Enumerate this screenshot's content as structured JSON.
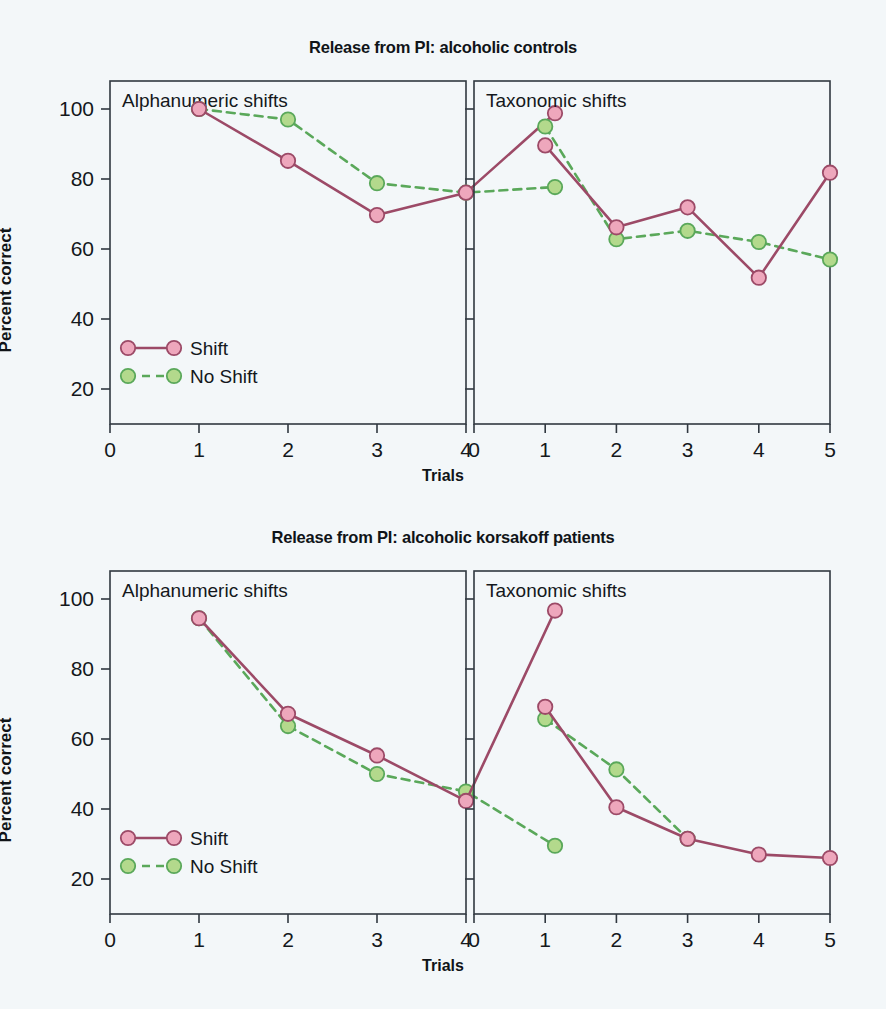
{
  "figure": {
    "axis": {
      "ylabel": "Percent correct",
      "xlabel": "Trials",
      "yticks": [
        "20",
        "40",
        "60",
        "80",
        "100"
      ],
      "ytick_values": [
        20,
        40,
        60,
        80,
        100
      ],
      "ylim": [
        10,
        108
      ],
      "xticks_left": [
        "0",
        "1",
        "2",
        "3",
        "4"
      ],
      "xticks_right": [
        "0",
        "1",
        "2",
        "3",
        "4",
        "5"
      ],
      "xlim": [
        0,
        5.2
      ]
    },
    "legend": {
      "shift_label": "Shift",
      "noshift_label": "No Shift"
    },
    "colors": {
      "shift_marker": "#eea7bc",
      "shift_line": "#9c4a67",
      "noshift_marker": "#b3d98c",
      "noshift_line": "#5aa85a",
      "frame": "#303840",
      "background": "#f3f7f9"
    }
  },
  "chart_data": [
    {
      "type": "line",
      "title": "Release from PI: alcoholic controls",
      "xlabel": "Trials",
      "ylabel": "Percent correct",
      "ylim": [
        10,
        108
      ],
      "grid": false,
      "legend_position": "lower-left of left panel",
      "panels": [
        {
          "panel_label": "Alphanumeric shifts",
          "x": [
            1,
            2,
            3,
            4,
            5
          ],
          "xtick_labels": [
            "0",
            "1",
            "2",
            "3",
            "4"
          ],
          "series": [
            {
              "name": "Shift",
              "values": [
                100,
                85.2,
                69.7,
                76.1,
                98.8
              ]
            },
            {
              "name": "No Shift",
              "values": [
                100,
                97.0,
                78.8,
                76.1,
                77.7
              ]
            }
          ]
        },
        {
          "panel_label": "Taxonomic shifts",
          "x": [
            1,
            2,
            3,
            4,
            5
          ],
          "xtick_labels": [
            "0",
            "1",
            "2",
            "3",
            "4",
            "5"
          ],
          "series": [
            {
              "name": "Shift",
              "values": [
                89.6,
                66.2,
                71.9,
                51.8,
                81.8
              ]
            },
            {
              "name": "No Shift",
              "values": [
                95.0,
                62.8,
                65.2,
                62.0,
                57.0
              ]
            }
          ]
        }
      ]
    },
    {
      "type": "line",
      "title": "Release from PI: alcoholic korsakoff patients",
      "xlabel": "Trials",
      "ylabel": "Percent correct",
      "ylim": [
        10,
        108
      ],
      "grid": false,
      "legend_position": "lower-left of left panel",
      "panels": [
        {
          "panel_label": "Alphanumeric shifts",
          "x": [
            1,
            2,
            3,
            4,
            5
          ],
          "xtick_labels": [
            "0",
            "1",
            "2",
            "3",
            "4"
          ],
          "series": [
            {
              "name": "Shift",
              "values": [
                94.5,
                67.2,
                55.3,
                42.3,
                96.7
              ]
            },
            {
              "name": "No Shift",
              "values": [
                94.5,
                63.7,
                50.0,
                45.0,
                29.5
              ]
            }
          ]
        },
        {
          "panel_label": "Taxonomic shifts",
          "x": [
            1,
            2,
            3,
            4,
            5
          ],
          "xtick_labels": [
            "0",
            "1",
            "2",
            "3",
            "4",
            "5"
          ],
          "series": [
            {
              "name": "Shift",
              "values": [
                69.2,
                40.5,
                31.5,
                27.0,
                26.0
              ]
            },
            {
              "name": "No Shift",
              "values": [
                65.7,
                51.3,
                31.5,
                null,
                null
              ]
            }
          ]
        }
      ]
    }
  ]
}
